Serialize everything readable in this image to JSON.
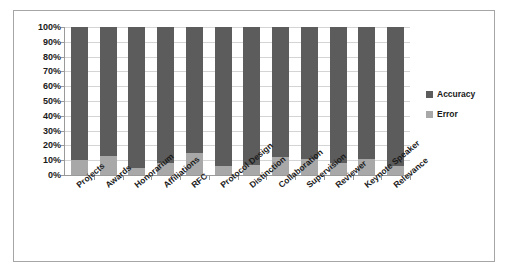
{
  "chart_data": {
    "type": "bar",
    "title": "",
    "subtitle": "",
    "xlabel": "",
    "ylabel": "",
    "stacked": true,
    "grid": true,
    "legend_position": "right",
    "ylim": [
      0,
      100
    ],
    "ytick_labels": [
      "100%",
      "90%",
      "80%",
      "70%",
      "60%",
      "50%",
      "40%",
      "30%",
      "20%",
      "10%",
      "0%"
    ],
    "ytick_values": [
      100,
      90,
      80,
      70,
      60,
      50,
      40,
      30,
      20,
      10,
      0
    ],
    "categories": [
      "Projects",
      "Awards",
      "Honorarium",
      "Affiliations",
      "RFC",
      "Protocol Design",
      "Distinction",
      "Collaboration",
      "Supervision",
      "Reviewer",
      "Keynote Speaker",
      "Relevance"
    ],
    "series": [
      {
        "name": "Accuracy",
        "color": "#5c5c5c",
        "values": [
          90,
          87,
          95,
          92,
          85,
          94,
          93,
          88,
          89,
          92,
          89,
          94
        ]
      },
      {
        "name": "Error",
        "color": "#a8a8a8",
        "values": [
          10,
          13,
          5,
          8,
          15,
          6,
          7,
          12,
          11,
          8,
          11,
          6
        ]
      }
    ]
  },
  "legend": {
    "items": [
      {
        "label": "Accuracy",
        "color": "#5c5c5c"
      },
      {
        "label": "Error",
        "color": "#a8a8a8"
      }
    ]
  },
  "colors": {
    "accuracy": "#5c5c5c",
    "error": "#a8a8a8",
    "gridline": "#d4d4d4",
    "axis": "#9a9a9a",
    "frame_border": "#a6a6a6",
    "background": "#ffffff",
    "text": "#1a1a1a"
  }
}
